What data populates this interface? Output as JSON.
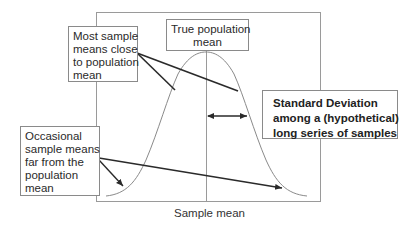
{
  "diagram": {
    "type": "annotated-normal-distribution",
    "x_axis_label": "Sample mean",
    "annotations": {
      "most_sample_means": {
        "lines": [
          "Most sample",
          "means close",
          "to population",
          "mean"
        ]
      },
      "true_population_mean": {
        "lines": [
          "True population",
          "mean"
        ]
      },
      "standard_deviation": {
        "lines": [
          "Standard Deviation",
          "among a (hypothetical)",
          "long series of samples"
        ]
      },
      "occasional_sample_means": {
        "lines": [
          "Occasional",
          "sample means",
          "far from the",
          "population",
          "mean"
        ]
      }
    },
    "colors": {
      "frame": "#9a9a9a",
      "curve": "#8a8a8a",
      "pointer_lines": "#2a2a2a",
      "text": "#2a2a2a"
    }
  }
}
